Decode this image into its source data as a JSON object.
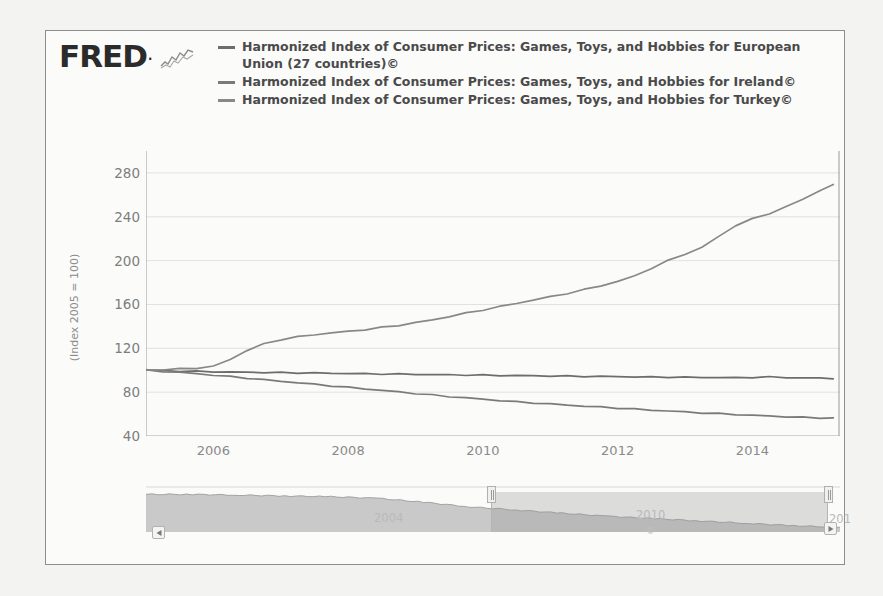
{
  "brand": {
    "name": "FRED",
    "dot": ".",
    "glyph_icon": "line-chart-glyph-icon"
  },
  "legend": {
    "entries": [
      {
        "label": "Harmonized Index of Consumer Prices: Games, Toys, and Hobbies for European Union (27 countries)©",
        "color": "#6d6d6d"
      },
      {
        "label": "Harmonized Index of Consumer Prices: Games, Toys, and Hobbies for Ireland©",
        "color": "#7a7a7a"
      },
      {
        "label": "Harmonized Index of Consumer Prices: Games, Toys, and Hobbies for Turkey©",
        "color": "#888888"
      }
    ]
  },
  "navigator": {
    "visible_years": [
      "2004",
      "2010",
      "201"
    ],
    "small_label": "©",
    "scroll_left_icon": "triangle-left-icon",
    "scroll_right_icon": "triangle-right-icon",
    "handle_left_icon": "drag-handle-icon",
    "handle_right_icon": "drag-handle-icon"
  },
  "chart_data": {
    "type": "line",
    "title": "",
    "xlabel": "",
    "ylabel": "(Index 2005 = 100)",
    "ylim": [
      40,
      300
    ],
    "xlim": [
      2005.0,
      2015.3
    ],
    "yticks": [
      280,
      240,
      200,
      160,
      120,
      80,
      40
    ],
    "xticks": [
      2006,
      2008,
      2010,
      2012,
      2014
    ],
    "grid": true,
    "legend_position": "top",
    "x": [
      2005.0,
      2005.25,
      2005.5,
      2005.75,
      2006.0,
      2006.25,
      2006.5,
      2006.75,
      2007.0,
      2007.25,
      2007.5,
      2007.75,
      2008.0,
      2008.25,
      2008.5,
      2008.75,
      2009.0,
      2009.25,
      2009.5,
      2009.75,
      2010.0,
      2010.25,
      2010.5,
      2010.75,
      2011.0,
      2011.25,
      2011.5,
      2011.75,
      2012.0,
      2012.25,
      2012.5,
      2012.75,
      2013.0,
      2013.25,
      2013.5,
      2013.75,
      2014.0,
      2014.25,
      2014.5,
      2014.75,
      2015.0,
      2015.2
    ],
    "series": [
      {
        "name": "European Union (27 countries)",
        "color": "#6d6d6d",
        "values": [
          100.0,
          99.6,
          99.3,
          99.0,
          98.7,
          98.4,
          98.2,
          98.0,
          97.8,
          97.6,
          97.4,
          97.2,
          97.0,
          96.8,
          96.6,
          96.4,
          96.2,
          96.0,
          95.8,
          95.7,
          95.5,
          95.3,
          95.1,
          95.0,
          94.8,
          94.6,
          94.5,
          94.3,
          94.1,
          94.0,
          93.8,
          93.7,
          93.5,
          93.4,
          93.3,
          93.2,
          93.5,
          93.8,
          93.4,
          93.0,
          92.8,
          92.6
        ]
      },
      {
        "name": "Ireland",
        "color": "#7a7a7a",
        "values": [
          100.0,
          99.0,
          98.0,
          96.8,
          95.5,
          94.2,
          92.8,
          91.4,
          90.0,
          88.6,
          87.2,
          85.8,
          84.4,
          83.0,
          81.6,
          80.2,
          78.8,
          77.4,
          76.0,
          74.8,
          73.6,
          72.4,
          71.2,
          70.2,
          69.2,
          68.2,
          67.2,
          66.3,
          65.4,
          64.5,
          63.6,
          62.8,
          62.0,
          61.2,
          60.4,
          59.6,
          58.9,
          58.2,
          57.5,
          57.0,
          56.5,
          56.2
        ]
      },
      {
        "name": "Turkey",
        "color": "#888888",
        "values": [
          100.0,
          100.5,
          101.2,
          102.0,
          103.5,
          110.0,
          118.0,
          124.0,
          128.0,
          130.5,
          132.5,
          134.0,
          135.5,
          137.0,
          139.0,
          141.0,
          143.5,
          146.0,
          149.0,
          152.0,
          155.0,
          158.0,
          161.0,
          164.0,
          167.0,
          170.0,
          173.5,
          177.0,
          181.0,
          186.0,
          193.0,
          200.0,
          206.0,
          212.0,
          222.0,
          232.0,
          238.0,
          243.0,
          249.0,
          256.0,
          264.0,
          269.0
        ]
      }
    ],
    "navigator_series": {
      "name": "navigator-overview",
      "x": [
        2000,
        2001,
        2002,
        2003,
        2004,
        2005,
        2006,
        2007,
        2008,
        2009,
        2010,
        2011,
        2012,
        2013,
        2014,
        2015
      ],
      "values": [
        100,
        100,
        99,
        98,
        97,
        95,
        90,
        84,
        80,
        76,
        72,
        69,
        66,
        63,
        60,
        58
      ]
    }
  }
}
